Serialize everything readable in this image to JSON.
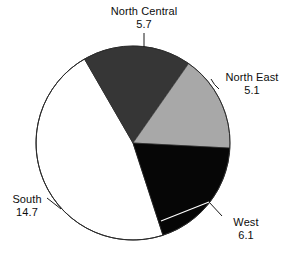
{
  "chart_data": {
    "type": "pie",
    "title": "",
    "subtitle": "",
    "xlabel": "",
    "ylabel": "",
    "legend_position": "none",
    "grid": false,
    "total": 31.6,
    "unit": "",
    "categories": [
      "North Central",
      "North East",
      "West",
      "South"
    ],
    "values": [
      5.7,
      5.1,
      6.1,
      14.7
    ],
    "slices": [
      {
        "label": "North Central",
        "value": "5.7",
        "numeric": 5.7,
        "color": "#363636",
        "start_angle_deg": 330,
        "end_angle_deg": 35,
        "sweep_deg": 65,
        "label_position": "top",
        "leader": "vertical"
      },
      {
        "label": "North East",
        "value": "5.1",
        "numeric": 5.1,
        "color": "#a8a8a8",
        "start_angle_deg": 35,
        "end_angle_deg": 93,
        "sweep_deg": 58,
        "label_position": "right",
        "leader": "curve-left"
      },
      {
        "label": "West",
        "value": "6.1",
        "numeric": 6.1,
        "color": "#060606",
        "start_angle_deg": 93,
        "end_angle_deg": 162,
        "sweep_deg": 69,
        "label_position": "bottom-right",
        "leader": "diagonal-up-left"
      },
      {
        "label": "South",
        "value": "14.7",
        "numeric": 14.7,
        "color": "#ffffff",
        "start_angle_deg": 162,
        "end_angle_deg": 330,
        "sweep_deg": 168,
        "label_position": "left",
        "leader": "diagonal-up-right"
      }
    ],
    "geometry": {
      "center_x": 133,
      "center_y": 143,
      "radius": 97
    },
    "style": {
      "background": "#ffffff",
      "outline_color": "#2b2b2b",
      "outline_width": 1,
      "leader_color": "#1a1a1a",
      "inner_leader_color": "#ffffff",
      "text_color": "#0d0d0d"
    }
  }
}
